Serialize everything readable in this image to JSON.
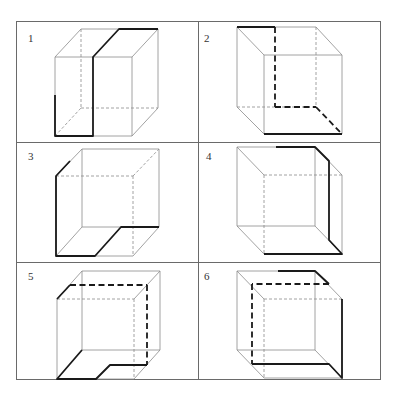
{
  "figure": {
    "type": "cube path puzzle",
    "grid": {
      "rows": 3,
      "cols": 2
    },
    "colors": {
      "thin_edge": "#8a8a8a",
      "bold_path": "#1a1a1a",
      "grid": "#6a6a6a",
      "background": "#ffffff"
    },
    "panels": [
      {
        "label": "1",
        "description": "Cube with front face lower-left; bold path splits front face vertically and continues over top to back-right edge"
      },
      {
        "label": "2",
        "description": "Cube viewed from upper-left; bold top-left edge, dashed hidden path down the back and across floor to bold front-bottom edge"
      },
      {
        "label": "3",
        "description": "Cube with back face upper-right; bold path down front-left edge and across floor, stepping back to back-bottom edge"
      },
      {
        "label": "4",
        "description": "Cube with front face lower-right; bold path across top, down the right side face, and along front-bottom edge"
      },
      {
        "label": "5",
        "description": "Cube with dashed bold loop across an inner plane and stepped floor path"
      },
      {
        "label": "6",
        "description": "Cube with dashed bold inner plane loop connecting top edge to front-right vertical and bottom"
      }
    ]
  }
}
